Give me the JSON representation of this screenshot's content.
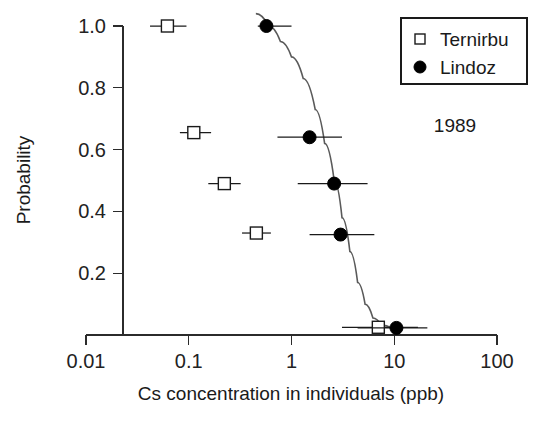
{
  "chart_data": {
    "type": "scatter",
    "title": "",
    "xlabel": "Cs concentration in individuals (ppb)",
    "ylabel": "Probability",
    "xscale": "log",
    "xlim": [
      0.01,
      100
    ],
    "ylim": [
      0.0,
      1.04
    ],
    "grid": false,
    "xticks": [
      0.01,
      0.1,
      1,
      10,
      100
    ],
    "xticklabels": [
      "0.01",
      "0.1",
      "1",
      "10",
      "100"
    ],
    "yticks": [
      0.2,
      0.4,
      0.6,
      0.8,
      1.0
    ],
    "yticklabels": [
      "0.2",
      "0.4",
      "0.6",
      "0.8",
      "1.0"
    ],
    "annotations": [
      {
        "text": "1989",
        "x": 30.0,
        "y": 0.655
      }
    ],
    "legend": {
      "position": "top-right",
      "entries": [
        {
          "label": "Ternirbu",
          "marker": "open-square"
        },
        {
          "label": "Lindoz",
          "marker": "filled-circle"
        }
      ]
    },
    "series": [
      {
        "name": "Ternirbu",
        "marker": "open-square",
        "points": [
          {
            "x": 0.062,
            "y": 1.0,
            "xlow": 0.042,
            "xhigh": 0.095
          },
          {
            "x": 0.112,
            "y": 0.655,
            "xlow": 0.082,
            "xhigh": 0.165
          },
          {
            "x": 0.222,
            "y": 0.49,
            "xlow": 0.155,
            "xhigh": 0.32
          },
          {
            "x": 0.455,
            "y": 0.33,
            "xlow": 0.33,
            "xhigh": 0.63
          },
          {
            "x": 7.0,
            "y": 0.025,
            "xlow": 3.1,
            "xhigh": 17.0
          }
        ]
      },
      {
        "name": "Lindoz",
        "marker": "filled-circle",
        "points": [
          {
            "x": 0.57,
            "y": 1.0,
            "xlow": 0.47,
            "xhigh": 1.0
          },
          {
            "x": 1.5,
            "y": 0.64,
            "xlow": 0.73,
            "xhigh": 3.1
          },
          {
            "x": 2.6,
            "y": 0.49,
            "xlow": 1.15,
            "xhigh": 5.5
          },
          {
            "x": 3.0,
            "y": 0.325,
            "xlow": 1.5,
            "xhigh": 6.4
          },
          {
            "x": 10.5,
            "y": 0.023,
            "xlow": 4.4,
            "xhigh": 21.0
          }
        ]
      }
    ],
    "fit_curve": {
      "name": "Lindoz fitted dose-response",
      "points": [
        {
          "x": 0.45,
          "y": 1.04
        },
        {
          "x": 0.6,
          "y": 1.0
        },
        {
          "x": 0.78,
          "y": 0.95
        },
        {
          "x": 1.0,
          "y": 0.9
        },
        {
          "x": 1.3,
          "y": 0.83
        },
        {
          "x": 1.7,
          "y": 0.73
        },
        {
          "x": 2.1,
          "y": 0.62
        },
        {
          "x": 2.6,
          "y": 0.5
        },
        {
          "x": 3.1,
          "y": 0.38
        },
        {
          "x": 3.7,
          "y": 0.27
        },
        {
          "x": 4.4,
          "y": 0.17
        },
        {
          "x": 5.2,
          "y": 0.1
        },
        {
          "x": 6.2,
          "y": 0.055
        },
        {
          "x": 7.5,
          "y": 0.032
        },
        {
          "x": 9.5,
          "y": 0.022
        },
        {
          "x": 12.0,
          "y": 0.018
        }
      ]
    }
  }
}
